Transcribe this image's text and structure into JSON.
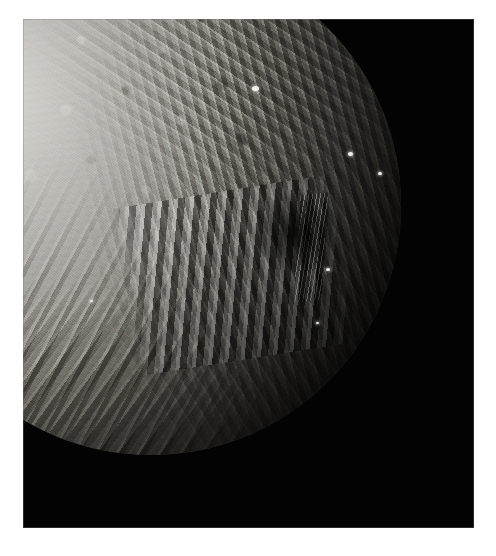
{
  "image": {
    "subject": "Miranda",
    "kind": "photograph",
    "palette": {
      "frame_background": "#ffffff",
      "sky_black": "#030303",
      "terrain_bright": "#cfcdc9",
      "terrain_mid": "#83817a",
      "terrain_dark": "#24231f",
      "highlight_white": "#f2f1ee"
    },
    "plate": {
      "left": 23,
      "top": 19,
      "width": 451,
      "height": 509
    },
    "disc": {
      "left": -122,
      "top": -64,
      "diameter": 500
    },
    "regions": [
      {
        "name": "cratered-highlands",
        "note": "upper-left bright cratered terrain"
      },
      {
        "name": "inverness-corona-chevron",
        "note": "nested banded chevron at center"
      },
      {
        "name": "arden-elsinore-banded-ridges",
        "note": "parallel ridge bands, lower left limb"
      },
      {
        "name": "grooved-terminator-terrain",
        "note": "ridges fading into shadow on the right"
      },
      {
        "name": "data-dropout-notch",
        "note": "black rectangular gap, lower right"
      }
    ],
    "highlights": [
      {
        "name": "bright-spot-north",
        "x": 252,
        "y": 86,
        "size": 7
      },
      {
        "name": "bright-spot-east-rim",
        "x": 348,
        "y": 152,
        "size": 5
      },
      {
        "name": "bright-spot-east-crater",
        "x": 378,
        "y": 172,
        "size": 4
      },
      {
        "name": "bright-spot-scarp",
        "x": 326,
        "y": 268,
        "size": 4
      },
      {
        "name": "bright-spot-lower",
        "x": 316,
        "y": 322,
        "size": 3
      },
      {
        "name": "bright-spot-limb",
        "x": 90,
        "y": 300,
        "size": 3
      }
    ]
  }
}
